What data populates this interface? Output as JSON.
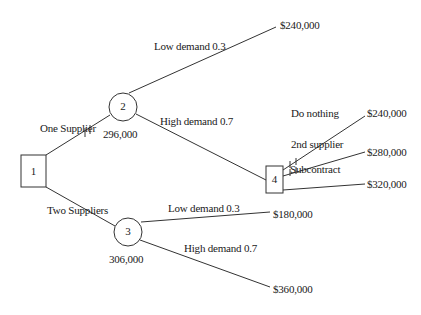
{
  "diagram": {
    "type": "decision-tree",
    "nodes": [
      {
        "id": "1",
        "kind": "decision",
        "label": "1"
      },
      {
        "id": "2",
        "kind": "chance",
        "label": "2",
        "value": "296,000"
      },
      {
        "id": "3",
        "kind": "chance",
        "label": "3",
        "value": "306,000"
      },
      {
        "id": "4",
        "kind": "decision",
        "label": "4"
      }
    ],
    "branches": {
      "one_supplier": "One Supplier",
      "two_suppliers": "Two Suppliers",
      "n2_low": "Low demand 0.3",
      "n2_high": "High demand 0.7",
      "do_nothing": "Do nothing",
      "second_supplier": "2nd supplier",
      "subcontract": "Subcontract",
      "n3_low": "Low demand 0.3",
      "n3_high": "High demand 0.7"
    },
    "payoffs": {
      "n2_low": "$240,000",
      "do_nothing": "$240,000",
      "second_supplier": "$280,000",
      "subcontract": "$320,000",
      "n3_low": "$180,000",
      "n3_high": "$360,000"
    }
  }
}
